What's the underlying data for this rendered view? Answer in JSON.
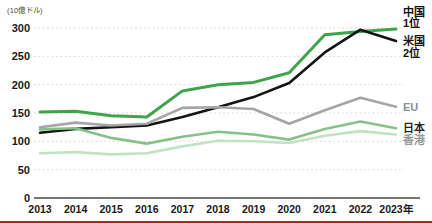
{
  "unit_label": "(10億ドル)",
  "colors": {
    "background": "#ffffff",
    "grid": "#e3cdc6",
    "axis": "#4a4a4a",
    "tick_text": "#1a1a1a",
    "accent_bar": "#962f26"
  },
  "chart_data": {
    "type": "line",
    "title": "",
    "unit": "10億ドル",
    "x": [
      2013,
      2014,
      2015,
      2016,
      2017,
      2018,
      2019,
      2020,
      2021,
      2022,
      2023
    ],
    "x_tick_labels": [
      "2013",
      "2014",
      "2015",
      "2016",
      "2017",
      "2018",
      "2019",
      "2020",
      "2021",
      "2022",
      "2023年"
    ],
    "y_ticks": [
      0,
      50,
      100,
      150,
      200,
      250,
      300
    ],
    "ylim": [
      0,
      300
    ],
    "grid": "dotted",
    "legend_position": "right-end-labels",
    "series": [
      {
        "key": "china",
        "name": "中国",
        "rank_label": "1位",
        "color": "#3ea44b",
        "width": 3,
        "label_color": "#111111",
        "label_lines": [
          {
            "text": "中国",
            "dy": -13
          },
          {
            "text": "1位",
            "dy": -2
          }
        ],
        "values": [
          152,
          153,
          145,
          143,
          189,
          200,
          204,
          221,
          288,
          294,
          298
        ]
      },
      {
        "key": "usa",
        "name": "米国",
        "rank_label": "2位",
        "color": "#141414",
        "width": 2.6,
        "label_color": "#111111",
        "label_lines": [
          {
            "text": "米国",
            "dy": 4
          },
          {
            "text": "2位",
            "dy": 16
          }
        ],
        "values": [
          115,
          122,
          125,
          128,
          143,
          160,
          178,
          203,
          257,
          297,
          277
        ]
      },
      {
        "key": "eu",
        "name": "EU",
        "rank_label": "",
        "color": "#a5a5a5",
        "width": 2.6,
        "label_color": "#8f8f8f",
        "label_lines": [
          {
            "text": "EU",
            "dy": 4
          }
        ],
        "values": [
          125,
          133,
          128,
          131,
          159,
          160,
          157,
          131,
          155,
          177,
          161
        ]
      },
      {
        "key": "japan",
        "name": "日本",
        "rank_label": "",
        "color": "#85c289",
        "width": 2.6,
        "label_color": "#222222",
        "label_lines": [
          {
            "text": "日本",
            "dy": 3.5
          }
        ],
        "values": [
          121,
          123,
          106,
          96,
          108,
          117,
          112,
          103,
          122,
          135,
          123
        ]
      },
      {
        "key": "hongkong",
        "name": "香港",
        "rank_label": "",
        "color": "#c3e2c4",
        "width": 2.6,
        "label_color": "#999999",
        "label_lines": [
          {
            "text": "香港",
            "dy": 9
          }
        ],
        "values": [
          79,
          81,
          77,
          79,
          91,
          101,
          100,
          97,
          110,
          118,
          112
        ]
      }
    ]
  }
}
